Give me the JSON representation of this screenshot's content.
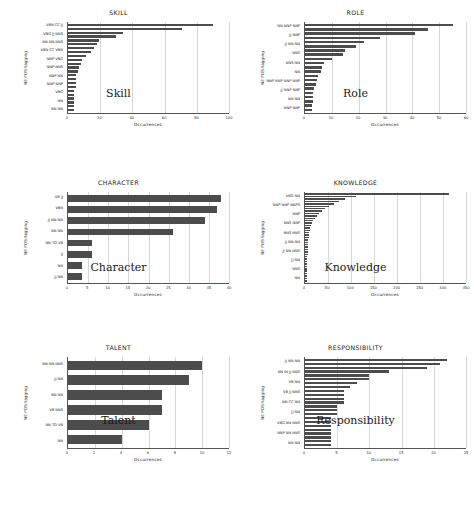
{
  "page": {
    "axis_y_label": "NE POS-tagging",
    "axis_x_label": "Occurrences"
  },
  "figures": [
    {
      "id": "skill",
      "title": "SKILL",
      "caption": "Skill",
      "chart_data": {
        "type": "bar",
        "orientation": "horizontal",
        "title": "SKILL",
        "xlabel": "Occurrences",
        "ylabel": "NE POS-tagging",
        "xlim": [
          0,
          100
        ],
        "xticks": [
          0,
          20,
          40,
          60,
          80,
          100
        ],
        "grid": true,
        "categories": [
          "VBN CC JJ",
          "",
          "",
          "VBG JJ NNS",
          "",
          "",
          "NN NN NNS",
          "",
          "",
          "VBN CC VBN",
          "",
          "NNP VBG",
          "",
          "NNP NNS",
          "",
          "NNP NN",
          "",
          "NNP NNP",
          "",
          "VBG",
          "NN",
          "NN NN"
        ],
        "tick_labels": [
          "VBN CC JJ",
          "VBG JJ NNS",
          "NN NN NNS",
          "VBN CC VBN",
          "NNP VBG",
          "NNP NNS",
          "NNP NN",
          "NNP NNP",
          "VBG",
          "NN",
          "NN NN"
        ],
        "values": [
          4,
          4,
          4,
          4,
          4,
          4,
          5,
          5,
          5,
          5,
          6,
          7,
          8,
          9,
          11,
          14,
          16,
          18,
          19,
          30,
          34,
          71,
          90
        ]
      }
    },
    {
      "id": "role",
      "title": "ROLE",
      "caption": "Role",
      "chart_data": {
        "type": "bar",
        "orientation": "horizontal",
        "title": "ROLE",
        "xlabel": "Occurrences",
        "ylabel": "NE POS-tagging",
        "xlim": [
          0,
          60
        ],
        "xticks": [
          0,
          10,
          20,
          30,
          40,
          50,
          60
        ],
        "grid": true,
        "tick_labels": [
          "NN NNP NNP",
          "JJ NNP",
          "JJ NN NN",
          "NNS",
          "NNS NN",
          "NN",
          "NNP NNP NNP NNP",
          "JJ NNP NNP",
          "NN NN",
          "NNP NNP"
        ],
        "values": [
          2.5,
          2.5,
          2.8,
          3,
          3,
          3.2,
          4,
          4.5,
          5,
          6,
          6.5,
          7,
          10,
          14,
          15,
          19,
          22,
          28,
          41,
          46,
          55
        ]
      }
    },
    {
      "id": "character",
      "title": "CHARACTER",
      "caption": "Character",
      "chart_data": {
        "type": "bar",
        "orientation": "horizontal",
        "title": "CHARACTER",
        "xlabel": "Occurrences",
        "ylabel": "NE POS-tagging",
        "xlim": [
          0,
          40
        ],
        "xticks": [
          0,
          5,
          10,
          15,
          20,
          25,
          30,
          35,
          40
        ],
        "grid": true,
        "tick_labels": [
          "VB JJ",
          "VBN",
          "JJ NN NN",
          "NN NN",
          "NN TO VB",
          "JJ",
          "NN",
          "JJ NN"
        ],
        "values": [
          3.5,
          3.5,
          6,
          6,
          26,
          34,
          37,
          38
        ]
      }
    },
    {
      "id": "knowledge",
      "title": "KNOWLEDGE",
      "caption": "Knowledge",
      "chart_data": {
        "type": "bar",
        "orientation": "horizontal",
        "title": "KNOWLEDGE",
        "xlabel": "Occurrences",
        "ylabel": "NE POS-tagging",
        "xlim": [
          0,
          350
        ],
        "xticks": [
          0,
          50,
          100,
          150,
          200,
          250,
          300,
          350
        ],
        "grid": true,
        "tick_labels": [
          "VBG NN",
          "NNP NNP NNPS",
          "NNP",
          "NNS NNP",
          "NNS NNS",
          "JJ NN NN",
          "JJ NN NNS",
          "JJ NN",
          "NNS",
          "NN"
        ],
        "values": [
          4,
          4,
          4,
          4,
          4,
          5,
          5,
          5,
          5,
          5,
          5,
          6,
          6,
          6,
          6,
          7,
          7,
          7,
          8,
          8,
          9,
          10,
          11,
          13,
          15,
          18,
          21,
          25,
          30,
          36,
          44,
          52,
          62,
          74,
          88,
          110,
          312
        ]
      }
    },
    {
      "id": "talent",
      "title": "TALENT",
      "caption": "Talent",
      "chart_data": {
        "type": "bar",
        "orientation": "horizontal",
        "title": "TALENT",
        "xlabel": "Occurrences",
        "ylabel": "NE POS-tagging",
        "xlim": [
          0,
          12
        ],
        "xticks": [
          0,
          2,
          4,
          6,
          8,
          10,
          12
        ],
        "grid": true,
        "tick_labels": [
          "NN NN NNS",
          "JJ NN",
          "NN NN",
          "VB NNS",
          "NN TO VB",
          "NN"
        ],
        "values": [
          4,
          6,
          7,
          7,
          9,
          10
        ]
      }
    },
    {
      "id": "responsibility",
      "title": "RESPONSIBILITY",
      "caption": "Responsibility",
      "chart_data": {
        "type": "bar",
        "orientation": "horizontal",
        "title": "RESPONSIBILITY",
        "xlabel": "Occurrences",
        "ylabel": "NE POS-tagging",
        "xlim": [
          0,
          25
        ],
        "xticks": [
          0,
          5,
          10,
          15,
          20,
          25
        ],
        "grid": true,
        "tick_labels": [
          "JJ NN NN",
          "NN IN JJ NNS",
          "VB NN",
          "VB JJ NNS",
          "NN CC NN",
          "JJ NN",
          "VBG NN NNS",
          "NNP NN NNS",
          "NN NN"
        ],
        "values": [
          4,
          4,
          4,
          4,
          4,
          4,
          4,
          4,
          5,
          5,
          5,
          6,
          6,
          6,
          6,
          7,
          8,
          10,
          10,
          13,
          19,
          21,
          22
        ]
      }
    }
  ]
}
